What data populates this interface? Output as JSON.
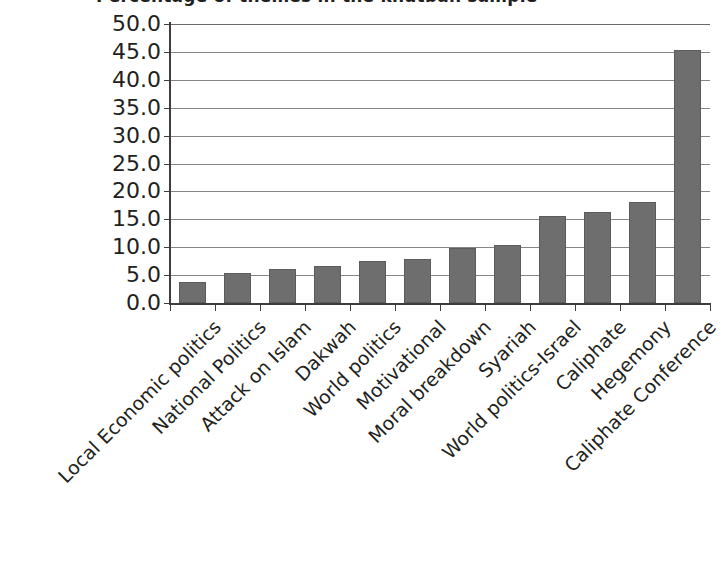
{
  "chart_data": {
    "type": "bar",
    "title": "Percentage of themes in the khutbah sample",
    "xlabel": "",
    "ylabel": "",
    "ylim": [
      0.0,
      50.0
    ],
    "ytick_step": 5.0,
    "ytick_labels": [
      "50.0",
      "45.0",
      "40.0",
      "35.0",
      "30.0",
      "25.0",
      "20.0",
      "15.0",
      "10.0",
      "5.0",
      "0.0"
    ],
    "ytick_values": [
      50.0,
      45.0,
      40.0,
      35.0,
      30.0,
      25.0,
      20.0,
      15.0,
      10.0,
      5.0,
      0.0
    ],
    "grid": true,
    "legend": false,
    "legend_position": "none",
    "bar_color": "#6e6e6e",
    "bar_border_color": "#5c5c5c",
    "gridline_color": "#868686",
    "axis_color": "#3d3d3d",
    "text_color": "#231f20",
    "categories": [
      "Local Economic politics",
      "National Politics",
      "Attack on Islam",
      "Dakwah",
      "World politics",
      "Motivational",
      "Moral breakdown",
      "Syariah",
      "World politics-Israel",
      "Caliphate",
      "Hegemony",
      "Caliphate Conference"
    ],
    "values": [
      3.7,
      5.3,
      6.1,
      6.6,
      7.6,
      7.8,
      9.9,
      10.4,
      15.6,
      16.4,
      18.1,
      45.3
    ]
  },
  "notes": {
    "title_truncated": "true"
  }
}
